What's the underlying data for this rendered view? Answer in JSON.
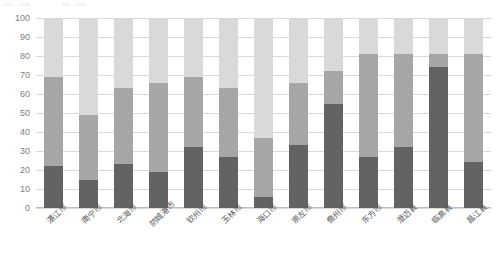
{
  "chart_data": {
    "type": "bar",
    "subtype": "100% stacked column",
    "title": "",
    "subtitle": "",
    "xlabel": "",
    "ylabel": "",
    "ylim": [
      0,
      100
    ],
    "yticks": [
      0,
      10,
      20,
      30,
      40,
      50,
      60,
      70,
      80,
      90,
      100
    ],
    "grid": true,
    "legend": "none",
    "categories": [
      "湛江市",
      "南宁市",
      "北海市",
      "防城港市",
      "钦州市",
      "玉林市",
      "海口市",
      "崇左市",
      "儋州市",
      "东方市",
      "澄迈县",
      "临高县",
      "昌江县"
    ],
    "series": [
      {
        "name": "series-1",
        "color": "#636363",
        "values": [
          22,
          15,
          23,
          19,
          32,
          27,
          6,
          33,
          55,
          27,
          32,
          74,
          24
        ]
      },
      {
        "name": "series-2",
        "color": "#a6a6a6",
        "values": [
          47,
          34,
          40,
          47,
          37,
          36,
          31,
          33,
          17,
          54,
          49,
          7,
          57
        ]
      },
      {
        "name": "series-3",
        "color": "#d9d9d9",
        "values": [
          31,
          51,
          37,
          34,
          31,
          37,
          63,
          34,
          28,
          19,
          19,
          19,
          19
        ]
      }
    ],
    "cumulative_tops": {
      "series-1": [
        22,
        15,
        23,
        19,
        32,
        27,
        6,
        33,
        55,
        27,
        32,
        74,
        24
      ],
      "series-2": [
        69,
        49,
        63,
        66,
        69,
        63,
        37,
        66,
        72,
        81,
        81,
        81,
        81
      ],
      "series-3": [
        100,
        100,
        100,
        100,
        100,
        100,
        100,
        100,
        100,
        100,
        100,
        100,
        100
      ]
    },
    "colors": {
      "series_1": "#636363",
      "series_2": "#a6a6a6",
      "series_3": "#d9d9d9",
      "gridline": "#d9d9d9",
      "axis": "#bfbfbf",
      "tick_text": "#7f7f7f",
      "category_text": "#595959",
      "plot_background": "#ffffff"
    }
  }
}
